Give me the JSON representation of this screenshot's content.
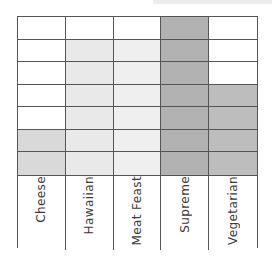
{
  "chart_data": {
    "type": "bar",
    "subtype": "block-graph",
    "title": "",
    "xlabel": "",
    "ylabel": "",
    "categories": [
      "Cheese",
      "Hawaiian",
      "Meat Feast",
      "Supreme",
      "Vegetarian"
    ],
    "values": [
      2,
      6,
      6,
      7,
      4
    ],
    "rows": 7,
    "ylim": [
      0,
      7
    ],
    "grid": true,
    "legend": "none",
    "bar_colors": [
      "#d9d9d9",
      "#e9e9e9",
      "#efefef",
      "#b2b2b2",
      "#bdbdbd"
    ],
    "empty_color": "#ffffff",
    "line_color": "#555555",
    "label_color": "#3a3a3a"
  }
}
